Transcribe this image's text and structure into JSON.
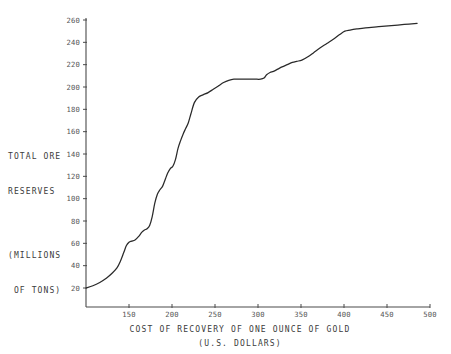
{
  "chart_data": {
    "type": "line",
    "title": "",
    "xlabel": "COST OF RECOVERY OF ONE OUNCE OF GOLD",
    "xlabel_sub": "(U.S. DOLLARS)",
    "ylabel_lines": [
      "TOTAL ORE",
      "RESERVES",
      "(MILLIONS",
      " OF TONS)"
    ],
    "xlim": [
      100,
      500
    ],
    "ylim": [
      0,
      268
    ],
    "grid": false,
    "legend": null,
    "xticks": [
      150,
      200,
      250,
      300,
      350,
      400,
      450,
      500
    ],
    "xtick_labels": [
      "150",
      "200",
      "250",
      "300",
      "350",
      "400",
      "450",
      "500"
    ],
    "yticks": [
      20,
      40,
      60,
      80,
      100,
      120,
      140,
      160,
      180,
      200,
      220,
      240,
      260
    ],
    "ytick_labels": [
      "20",
      "40",
      "60",
      "80",
      "100",
      "120",
      "140",
      "160",
      "180",
      "200",
      "220",
      "240",
      "260"
    ],
    "series": [
      {
        "name": "Total ore reserves",
        "color": "#2a2a2a",
        "x": [
          100,
          108,
          116,
          124,
          130,
          136,
          140,
          144,
          147,
          150,
          153,
          157,
          161,
          165,
          168,
          171,
          174,
          177,
          180,
          183,
          186,
          189,
          192,
          195,
          198,
          201,
          204,
          207,
          210,
          213,
          216,
          219,
          222,
          226,
          231,
          236,
          242,
          248,
          254,
          260,
          266,
          272,
          280,
          288,
          296,
          303,
          307,
          310,
          314,
          318,
          323,
          328,
          334,
          340,
          345,
          351,
          358,
          365,
          372,
          380,
          388,
          395,
          401,
          407,
          415,
          425,
          440,
          455,
          470,
          485
        ],
        "y": [
          20,
          22,
          25,
          29,
          33,
          38,
          44,
          52,
          58,
          61,
          62,
          63,
          66,
          70,
          72,
          73,
          76,
          84,
          96,
          104,
          108,
          111,
          117,
          123,
          127,
          129,
          135,
          145,
          152,
          158,
          163,
          168,
          176,
          186,
          191,
          193,
          195,
          198,
          201,
          204,
          206,
          207,
          207,
          207,
          207,
          207,
          208,
          211,
          213,
          214,
          216,
          218,
          220,
          222,
          223,
          224,
          227,
          231,
          235,
          239,
          243,
          247,
          250,
          251,
          252,
          253,
          254,
          255,
          256,
          257
        ]
      }
    ]
  },
  "geometry": {
    "plot_left": 86,
    "plot_right": 430,
    "plot_bottom": 307,
    "axis_top": 18,
    "y_value_top": 260,
    "y_pixel_top": 20,
    "y_value_bottom": 20,
    "y_pixel_bottom": 288
  }
}
